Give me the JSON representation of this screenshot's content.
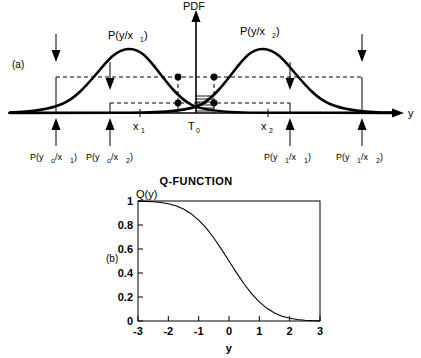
{
  "figure": {
    "panel_a": {
      "tag": "(a)",
      "y_axis_label": "PDF",
      "x_axis_label": "y",
      "curve1_label": "P(y/x",
      "curve1_sub": "1",
      "curve1_close": ")",
      "curve2_label": "P(y/x",
      "curve2_sub": "2",
      "curve2_close": ")",
      "tick_x1": "x",
      "tick_x1_sub": "1",
      "tick_T0": "T",
      "tick_T0_sub": "0",
      "tick_x2": "x",
      "tick_x2_sub": "2",
      "annotations": [
        {
          "base": "P(y",
          "sub1": "o",
          "mid": "/x",
          "sub2": "1",
          "close": ")"
        },
        {
          "base": "P(y",
          "sub1": "o",
          "mid": "/x",
          "sub2": "2",
          "close": ")"
        },
        {
          "base": "P(y",
          "sub1": "1",
          "mid": "/x",
          "sub2": "1",
          "close": ")"
        },
        {
          "base": "P(y",
          "sub1": "1",
          "mid": "/x",
          "sub2": "2",
          "close": ")"
        }
      ]
    },
    "panel_b": {
      "tag": "(b)",
      "title": "Q-FUNCTION",
      "y_axis_label": "Q(y)",
      "x_axis_label": "y",
      "x_ticks": [
        "-3",
        "-2",
        "-1",
        "0",
        "1",
        "2",
        "3"
      ],
      "y_ticks": [
        "0",
        "0.2",
        "0.4",
        "0.6",
        "0.8",
        "1"
      ]
    }
  },
  "chart_data": {
    "type": "line",
    "title": "Q-FUNCTION",
    "xlabel": "y",
    "ylabel": "Q(y)",
    "xlim": [
      -3,
      3
    ],
    "ylim": [
      0,
      1
    ],
    "grid": false,
    "legend": "none",
    "x": [
      -3,
      -2.75,
      -2.5,
      -2.25,
      -2,
      -1.75,
      -1.5,
      -1.25,
      -1,
      -0.75,
      -0.5,
      -0.25,
      0,
      0.25,
      0.5,
      0.75,
      1,
      1.25,
      1.5,
      1.75,
      2,
      2.25,
      2.5,
      2.75,
      3
    ],
    "series": [
      {
        "name": "Q(y)",
        "values": [
          0.9987,
          0.997,
          0.9938,
          0.9878,
          0.9772,
          0.9599,
          0.9332,
          0.8944,
          0.8413,
          0.7734,
          0.6915,
          0.5987,
          0.5,
          0.4013,
          0.3085,
          0.2266,
          0.1587,
          0.1056,
          0.0668,
          0.0401,
          0.0228,
          0.0122,
          0.0062,
          0.003,
          0.0013
        ]
      }
    ]
  }
}
